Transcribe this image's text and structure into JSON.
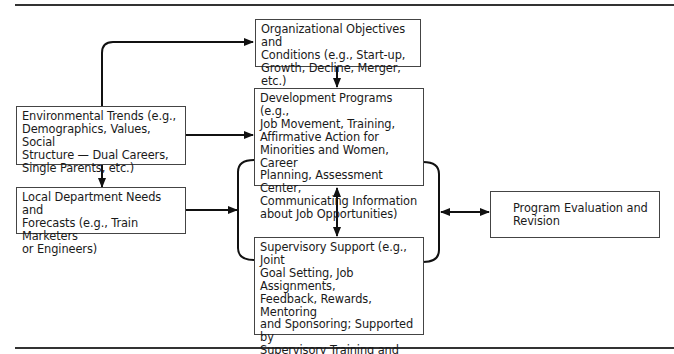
{
  "figure": {
    "boxes": {
      "org": "Organizational Objectives and\nConditions (e.g., Start-up,\nGrowth, Decline, Merger, etc.)",
      "env": "Environmental Trends (e.g.,\nDemographics, Values, Social\nStructure — Dual Careers,\nSingle Parents, etc.)",
      "dev": "Development Programs (e.g.,\nJob Movement, Training,\nAffirmative Action for\nMinorities and Women, Career\nPlanning, Assessment Center,\nCommunicating Information\nabout Job Opportunities)",
      "local": "Local Department Needs and\nForecasts (e.g., Train Marketers\nor Engineers)",
      "sup": "Supervisory Support (e.g., Joint\nGoal Setting, Job Assignments,\nFeedback, Rewards, Mentoring\nand Sponsoring; Supported by\nSupervisory Training and\nRewards for Developing\nSubordinates)",
      "eval": "Program Evaluation and\nRevision"
    },
    "colors": {
      "line": "#111111",
      "border": "#444444",
      "background": "#ffffff"
    }
  }
}
